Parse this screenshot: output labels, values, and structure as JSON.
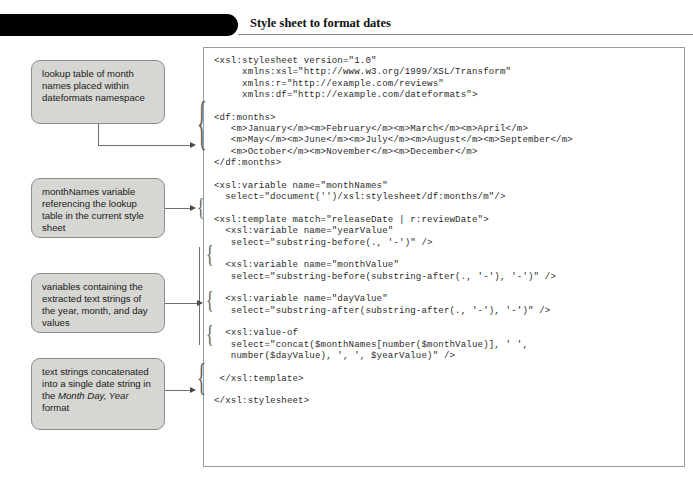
{
  "figure": {
    "number_label": "Figure 6-27",
    "title": "Style sheet to format dates"
  },
  "code": {
    "language": "xslt",
    "listing": "<xsl:stylesheet version=\"1.0\"\n     xmlns:xsl=\"http://www.w3.org/1999/XSL/Transform\"\n     xmlns:r=\"http://example.com/reviews\"\n     xmlns:df=\"http://example.com/dateformats\">\n\n<df:months>\n   <m>January</m><m>February</m><m>March</m><m>April</m>\n   <m>May</m><m>June</m><m>July</m><m>August</m><m>September</m>\n   <m>October</m><m>November</m><m>December</m>\n</df:months>\n\n<xsl:variable name=\"monthNames\"\n  select=\"document('')/xsl:stylesheet/df:months/m\"/>\n\n<xsl:template match=\"releaseDate | r:reviewDate\">\n  <xsl:variable name=\"yearValue\"\n   select=\"substring-before(., '-')\" />\n\n  <xsl:variable name=\"monthValue\"\n   select=\"substring-before(substring-after(., '-'), '-')\" />\n\n  <xsl:variable name=\"dayValue\"\n   select=\"substring-after(substring-after(., '-'), '-')\" />\n\n  <xsl:value-of\n   select=\"concat($monthNames[number($monthValue)], ' ',\n   number($dayValue), ', ', $yearValue)\" />\n\n </xsl:template>\n\n</xsl:stylesheet>"
  },
  "callouts": [
    {
      "id": "lookup-table",
      "text": "lookup table of month names placed within dateformats namespace"
    },
    {
      "id": "monthnames-variable",
      "text": "monthNames variable referencing the lookup table in the current style sheet"
    },
    {
      "id": "extracted-variables",
      "text": "variables containing the extracted text strings of the year, month, and day values"
    },
    {
      "id": "concatenated-string",
      "text_before": "text strings concatenated into a single date string in the ",
      "text_italic": "Month Day, Year",
      "text_after": " format"
    }
  ],
  "colors": {
    "banner_background": "#000000",
    "banner_text": "#ffffff",
    "callout_background": "#d6d6d2",
    "callout_border": "#8d8d8d",
    "code_border": "#9a9a9a",
    "code_text": "#2b2b2b",
    "connector": "#6e6e6e"
  }
}
